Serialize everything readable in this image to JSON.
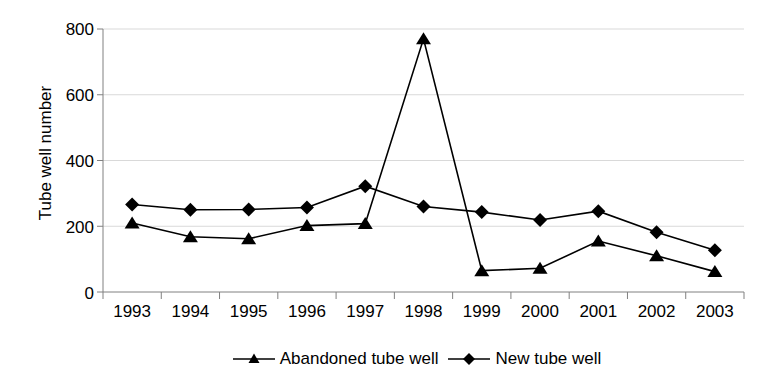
{
  "chart_data": {
    "type": "line",
    "title": "",
    "xlabel": "",
    "ylabel": "Tube well number",
    "categories": [
      "1993",
      "1994",
      "1995",
      "1996",
      "1997",
      "1998",
      "1999",
      "2000",
      "2001",
      "2002",
      "2003"
    ],
    "ylim": [
      0,
      800
    ],
    "yticks": [
      0,
      200,
      400,
      600,
      800
    ],
    "grid": true,
    "legend_position": "bottom",
    "series": [
      {
        "name": "Abandoned tube well",
        "marker": "triangle",
        "color": "#000000",
        "values": [
          210,
          168,
          162,
          202,
          208,
          770,
          65,
          72,
          155,
          110,
          62
        ]
      },
      {
        "name": "New tube well",
        "marker": "diamond",
        "color": "#000000",
        "values": [
          266,
          250,
          251,
          257,
          322,
          260,
          243,
          219,
          246,
          182,
          127
        ]
      }
    ]
  },
  "axis": {
    "y_tick_labels": [
      "800",
      "600",
      "400",
      "200",
      "0"
    ],
    "title_y": "Tube well number"
  },
  "legend": {
    "items": [
      {
        "label": "Abandoned tube well",
        "marker": "triangle-icon"
      },
      {
        "label": "New tube well",
        "marker": "diamond-icon"
      }
    ]
  }
}
